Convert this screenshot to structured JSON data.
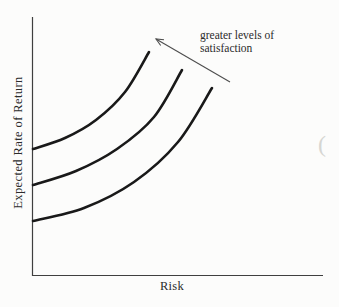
{
  "window": {
    "width": 339,
    "height": 307
  },
  "colors": {
    "background": "#fcfcfb",
    "axis": "#3f3f3f",
    "curve": "#191919",
    "arrow": "#4d4d4d",
    "text": "#2b2b2b",
    "artifact": "#d6d6d2"
  },
  "chart_data": {
    "type": "line",
    "title": "",
    "xlabel": "Risk",
    "ylabel": "Expected Rate of Return",
    "annotation": {
      "line1": "greater levels of",
      "line2": "satisfaction"
    },
    "layout": {
      "ticks": "none",
      "gridlines": false,
      "legend": "none",
      "qualitative": true,
      "units": "pixel coordinates of the 339x307 canvas, y increases downward"
    },
    "series": [
      {
        "name": "indifference-curve-1",
        "points": [
          [
            33,
            149
          ],
          [
            65,
            138
          ],
          [
            96,
            120
          ],
          [
            125,
            92
          ],
          [
            149,
            52
          ]
        ]
      },
      {
        "name": "indifference-curve-2",
        "points": [
          [
            33,
            185
          ],
          [
            76,
            171
          ],
          [
            117,
            149
          ],
          [
            154,
            117
          ],
          [
            182,
            70
          ]
        ]
      },
      {
        "name": "indifference-curve-3",
        "points": [
          [
            33,
            221
          ],
          [
            84,
            208
          ],
          [
            134,
            182
          ],
          [
            178,
            142
          ],
          [
            212,
            88
          ]
        ]
      }
    ],
    "arrow": {
      "x1": 230,
      "y1": 82,
      "x2": 156,
      "y2": 39
    }
  },
  "artifact": {
    "glyph": "("
  }
}
